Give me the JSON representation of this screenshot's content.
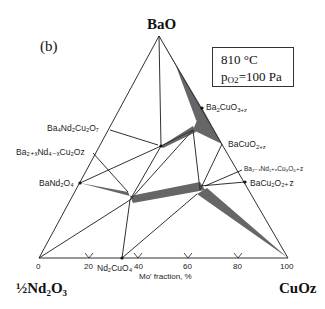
{
  "panel_label": "(b)",
  "conditions": {
    "temperature": "810 °C",
    "pressure_label": "p",
    "pressure_sub": "O2",
    "pressure_value": "=100 Pa"
  },
  "vertices": {
    "top": "BaO",
    "left": "½Nd₂O₃",
    "right": "CuOz"
  },
  "axis": {
    "label": "Mo' fraction, %",
    "ticks": [
      "0",
      "20",
      "40",
      "60",
      "80",
      "100"
    ]
  },
  "phases": {
    "ba2cuo3": {
      "base": "Ba",
      "s1": "2",
      "m": "CuO",
      "s2": "3+z"
    },
    "bacuo2": {
      "base": "BaCuO",
      "s1": "2+z"
    },
    "ba4nd2cu2o7": {
      "text": "Ba₄Nd₂Cu₂O₇"
    },
    "ba2nd4cu2o": {
      "text": "Ba₂₊ₓNd₄₋ₓCu₂Oz"
    },
    "band2o4": {
      "text": "BaNd₂O₄"
    },
    "ba2nd1cu3o6": {
      "text": "Ba₂₋ₓNd₁₊ₓCu₃O₆₊z"
    },
    "bacu2o2": {
      "text": "BaCu₂O₂₊z"
    },
    "nd2cuo4": {
      "text": "Nd₂CuO₄"
    }
  },
  "colors": {
    "line": "#1a1a1a",
    "background": "#ffffff"
  }
}
